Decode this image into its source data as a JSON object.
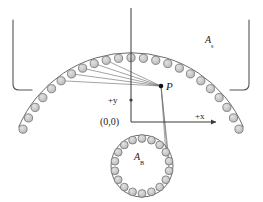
{
  "figure": {
    "type": "technical-line-diagram",
    "canvas": {
      "width": 263,
      "height": 202,
      "background": "#ffffff"
    }
  },
  "labels": {
    "point_p": "P",
    "surface_arc": "A",
    "surface_arc_sub": "s",
    "body_circle": "A",
    "body_circle_sub": "B",
    "axis_y": "+y",
    "axis_x": "+x",
    "origin": "(0,0)"
  },
  "colors": {
    "line": "#555555",
    "line_dark": "#333333",
    "node_fill": "#c9c9c9",
    "node_stroke": "#6e6e6e",
    "axis": "#3a3a3a",
    "text": "#1a1a1a",
    "ray": "#666666",
    "background": "#ffffff"
  },
  "geometry": {
    "origin": {
      "x": 131,
      "y": 122
    },
    "point_p": {
      "x": 161,
      "y": 86
    },
    "arc_top": {
      "center_x": 131,
      "center_y": 175,
      "radius": 122,
      "start_angle_deg": 203,
      "end_angle_deg": 337,
      "node_count": 23,
      "node_radius": 4.1
    },
    "circle_bottom": {
      "center_x": 142,
      "center_y": 166,
      "radius": 31,
      "node_count": 18,
      "node_radius": 3.9
    },
    "bracket_left": {
      "top_x": 13,
      "top_y": 20,
      "bottom_y": 88,
      "foot_x": 35
    },
    "bracket_right": {
      "top_x": 249,
      "top_y": 20,
      "bottom_y": 88,
      "foot_x": 227
    },
    "axis_y_top": {
      "x": 131,
      "y": 8
    },
    "axis_x_end": {
      "x": 218,
      "y": 122
    },
    "rays_to_arc_indices": [
      5,
      6,
      7,
      8,
      9
    ],
    "rays_to_circle_indices": [
      3,
      4,
      5
    ]
  },
  "chart_data": {
    "type": "scatter",
    "title": "",
    "xlabel": "+x",
    "ylabel": "+y",
    "annotations": [
      "P",
      "(0,0)",
      "A_s",
      "A_B"
    ]
  }
}
